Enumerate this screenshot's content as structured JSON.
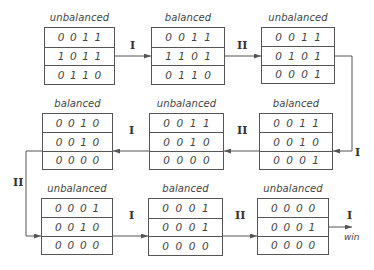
{
  "states": [
    {
      "label": "unbalanced",
      "rows": [
        [
          "0",
          "0",
          "1",
          "1"
        ],
        [
          "1",
          "0",
          "1",
          "1"
        ],
        [
          "0",
          "1",
          "1",
          "0"
        ]
      ],
      "x": 44,
      "y": 27,
      "w": 71,
      "h": 58
    },
    {
      "label": "balanced",
      "rows": [
        [
          "0",
          "0",
          "1",
          "1"
        ],
        [
          "1",
          "1",
          "0",
          "1"
        ],
        [
          "0",
          "1",
          "1",
          "0"
        ]
      ],
      "x": 151,
      "y": 27,
      "w": 74,
      "h": 58
    },
    {
      "label": "unbalanced",
      "rows": [
        [
          "0",
          "0",
          "1",
          "1"
        ],
        [
          "0",
          "1",
          "0",
          "1"
        ],
        [
          "0",
          "0",
          "0",
          "1"
        ]
      ],
      "x": 261,
      "y": 27,
      "w": 74,
      "h": 57
    },
    {
      "label": "balanced",
      "rows": [
        [
          "0",
          "0",
          "1",
          "0"
        ],
        [
          "0",
          "0",
          "1",
          "0"
        ],
        [
          "0",
          "0",
          "0",
          "0"
        ]
      ],
      "x": 42,
      "y": 113,
      "w": 71,
      "h": 57
    },
    {
      "label": "unbalanced",
      "rows": [
        [
          "0",
          "0",
          "1",
          "1"
        ],
        [
          "0",
          "0",
          "1",
          "0"
        ],
        [
          "0",
          "0",
          "0",
          "0"
        ]
      ],
      "x": 149,
      "y": 113,
      "w": 75,
      "h": 57
    },
    {
      "label": "balanced",
      "rows": [
        [
          "0",
          "0",
          "1",
          "1"
        ],
        [
          "0",
          "0",
          "1",
          "0"
        ],
        [
          "0",
          "0",
          "0",
          "1"
        ]
      ],
      "x": 259,
      "y": 113,
      "w": 74,
      "h": 57
    },
    {
      "label": "unbalanced",
      "rows": [
        [
          "0",
          "0",
          "0",
          "1"
        ],
        [
          "0",
          "0",
          "1",
          "0"
        ],
        [
          "0",
          "0",
          "0",
          "0"
        ]
      ],
      "x": 41,
      "y": 198,
      "w": 72,
      "h": 57
    },
    {
      "label": "balanced",
      "rows": [
        [
          "0",
          "0",
          "0",
          "1"
        ],
        [
          "0",
          "0",
          "0",
          "1"
        ],
        [
          "0",
          "0",
          "0",
          "0"
        ]
      ],
      "x": 148,
      "y": 198,
      "w": 75,
      "h": 58
    },
    {
      "label": "unbalanced",
      "rows": [
        [
          "0",
          "0",
          "0",
          "0"
        ],
        [
          "0",
          "0",
          "0",
          "1"
        ],
        [
          "0",
          "0",
          "0",
          "0"
        ]
      ],
      "x": 257,
      "y": 198,
      "w": 72,
      "h": 57
    }
  ],
  "operations": [
    {
      "label": "I",
      "x": 130,
      "y": 39
    },
    {
      "label": "II",
      "x": 237,
      "y": 39
    },
    {
      "label": "I",
      "x": 355,
      "y": 146
    },
    {
      "label": "II",
      "x": 237,
      "y": 124
    },
    {
      "label": "I",
      "x": 129,
      "y": 124
    },
    {
      "label": "II",
      "x": 13,
      "y": 176
    },
    {
      "label": "I",
      "x": 129,
      "y": 209
    },
    {
      "label": "II",
      "x": 235,
      "y": 209
    },
    {
      "label": "I",
      "x": 347,
      "y": 209
    }
  ],
  "end_label": "win",
  "colors": {
    "line": "#555555",
    "text": "#444444"
  }
}
